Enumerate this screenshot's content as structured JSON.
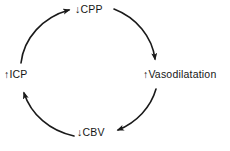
{
  "diagram": {
    "type": "cycle",
    "nodes": [
      {
        "id": "cpp",
        "label": "↓CPP",
        "position": "top"
      },
      {
        "id": "vasodilatation",
        "label": "↑Vasodilatation",
        "position": "right"
      },
      {
        "id": "cbv",
        "label": "↓CBV",
        "position": "bottom"
      },
      {
        "id": "icp",
        "label": "↑ICP",
        "position": "left"
      }
    ],
    "edges": [
      {
        "from": "icp",
        "to": "cpp",
        "direction": "clockwise"
      },
      {
        "from": "cpp",
        "to": "vasodilatation",
        "direction": "clockwise"
      },
      {
        "from": "vasodilatation",
        "to": "cbv",
        "direction": "clockwise"
      },
      {
        "from": "cbv",
        "to": "icp",
        "direction": "clockwise"
      }
    ],
    "colors": {
      "background": "#ffffff",
      "stroke": "#1a1a1a",
      "text": "#161616"
    }
  }
}
